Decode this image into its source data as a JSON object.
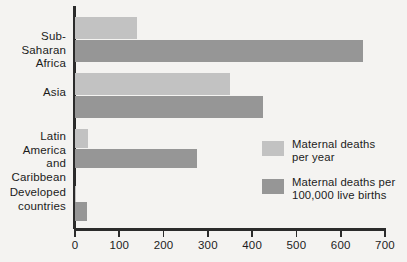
{
  "chart_data": {
    "type": "bar",
    "orientation": "horizontal",
    "title": "",
    "subtitle": "",
    "xlabel": "",
    "ylabel": "",
    "xlim": [
      0,
      700
    ],
    "xticks": [
      0,
      100,
      200,
      300,
      400,
      500,
      600,
      700
    ],
    "xtick_labels": [
      "0",
      "100",
      "200",
      "300",
      "400",
      "500",
      "600",
      "700"
    ],
    "grid": false,
    "legend_position": "inside-right",
    "categories": [
      "Sub-Saharan\nAfrica",
      "Asia",
      "Latin America\nand\nCaribbean",
      "Developed\ncountries"
    ],
    "series": [
      {
        "name": "Maternal deaths\nper year",
        "color": "#c2c2c2",
        "values": [
          140,
          350,
          30,
          2
        ]
      },
      {
        "name": "Maternal deaths per\n100,000 live births",
        "color": "#969696",
        "values": [
          650,
          425,
          275,
          27
        ]
      }
    ]
  },
  "axis": {
    "line_color": "#2b2b2b"
  },
  "legend": {
    "items": [
      {
        "label": "Maternal deaths\nper year",
        "color": "#c2c2c2"
      },
      {
        "label": "Maternal deaths per\n100,000 live births",
        "color": "#969696"
      }
    ]
  }
}
